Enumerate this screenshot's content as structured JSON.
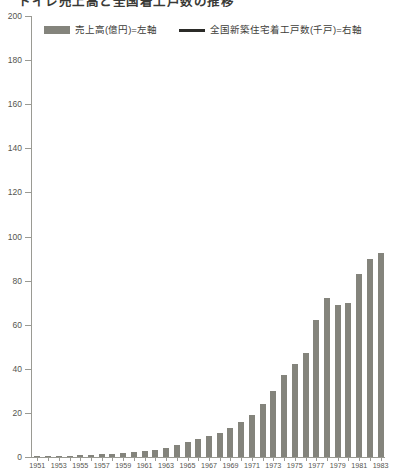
{
  "chart_title": "トイレ売上高と全国着工戸数の推移",
  "legend": {
    "position": "top",
    "entries": [
      {
        "label": "売上高(億円)=左軸",
        "marker": "bar-swatch-icon",
        "color": "#84847c"
      },
      {
        "label": "全国新築住宅着工戸数(千戸)=右軸",
        "marker": "line-swatch-icon",
        "color": "#2b2b28"
      }
    ]
  },
  "yaxis": {
    "ticks": [
      0,
      20,
      40,
      60,
      80,
      100,
      120,
      140,
      160,
      180,
      200
    ],
    "min": 0,
    "max": 200
  },
  "xaxis": {
    "labels": [
      "1951",
      "1953",
      "1955",
      "1957",
      "1959",
      "1961",
      "1963",
      "1965",
      "1967",
      "1969",
      "1971",
      "1973",
      "1975",
      "1977",
      "1979",
      "1981",
      "1983"
    ]
  },
  "chart_data": {
    "type": "bar",
    "title": "トイレ売上高と全国着工戸数の推移",
    "xlabel": "",
    "ylabel": "",
    "ylim": [
      0,
      200
    ],
    "grid": false,
    "legend_position": "top",
    "series": [
      {
        "name": "売上高(億円)=左軸",
        "color": "#84847c",
        "axis": "left",
        "values": [
          0.3,
          0.4,
          0.5,
          0.6,
          0.8,
          1.0,
          1.2,
          1.5,
          1.8,
          2.2,
          2.8,
          3.4,
          4.2,
          5.5,
          7.0,
          8.0,
          9.5,
          11.0,
          13.0,
          16.0,
          19.0,
          24.0,
          30.0,
          37.0,
          42.0,
          47.0,
          62.0,
          72.0,
          69.0,
          70.0,
          83.0,
          90.0,
          92.5
        ]
      }
    ],
    "categories": [
      "1951",
      "1952",
      "1953",
      "1954",
      "1955",
      "1956",
      "1957",
      "1958",
      "1959",
      "1960",
      "1961",
      "1962",
      "1963",
      "1964",
      "1965",
      "1966",
      "1967",
      "1968",
      "1969",
      "1970",
      "1971",
      "1972",
      "1973",
      "1974",
      "1975",
      "1976",
      "1977",
      "1978",
      "1979",
      "1980",
      "1981",
      "1982",
      "1983"
    ]
  },
  "colors": {
    "bar": "#84847c",
    "line": "#2b2b28",
    "axis": "#9a9a93",
    "text": "#55554f",
    "background": "#ffffff"
  }
}
